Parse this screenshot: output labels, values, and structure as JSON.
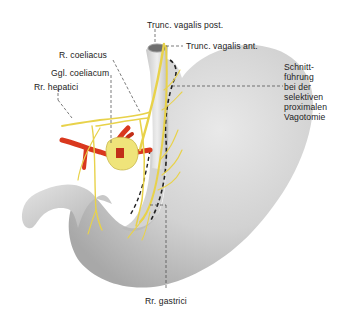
{
  "figure": {
    "colors": {
      "stomach": "#d4d4d4",
      "stomach_shadow": "#9c9c9c",
      "nerve": "#e8d24a",
      "nerve_outline": "#a89a2a",
      "artery": "#d9381e",
      "ganglion": "#efe47a",
      "leader_line": "#444444",
      "cut_line": "#222222"
    }
  },
  "labels": {
    "trunc_vagalis_post": "Trunc. vagalis post.",
    "trunc_vagalis_ant": "Trunc. vagalis ant.",
    "r_coeliacus": "R. coeliacus",
    "ggl_coeliacum": "Ggl. coeliacum",
    "rr_hepatici": "Rr. hepatici",
    "schnittfuehrung": [
      "Schnitt-",
      "führung",
      "bei der",
      "selektiven",
      "proximalen",
      "Vagotomie"
    ],
    "rr_gastrici": "Rr. gastrici"
  }
}
